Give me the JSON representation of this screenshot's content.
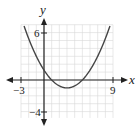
{
  "chart_data": {
    "type": "line",
    "title": "",
    "xlabel": "x",
    "ylabel": "y",
    "xlim": [
      -3,
      9
    ],
    "ylim": [
      -4,
      6
    ],
    "grid": true,
    "x_ticks_labeled": [
      "-3",
      "9"
    ],
    "y_ticks_labeled": [
      "6",
      "-4"
    ],
    "series": [
      {
        "name": "parabola",
        "equation_estimate": "y = 0.25(x - 3)^2 - 1",
        "vertex": [
          3,
          -1
        ],
        "x_intercepts": [
          1,
          5
        ],
        "y_intercept": 1.25,
        "x": [
          -2.6,
          -2,
          -1,
          0,
          1,
          2,
          3,
          4,
          5,
          6,
          7,
          8,
          8.6
        ],
        "values": [
          6.84,
          5.25,
          3,
          1.25,
          0,
          -0.75,
          -1,
          -0.75,
          0,
          1.25,
          3,
          5.25,
          6.84
        ]
      }
    ]
  },
  "labels": {
    "x_axis": "x",
    "y_axis": "y",
    "x_min_tick": "−3",
    "x_max_tick": "9",
    "y_max_tick": "6",
    "y_min_tick": "−4"
  },
  "colors": {
    "grid": "#d9d9d9",
    "axis": "#222222",
    "curve": "#444444"
  }
}
